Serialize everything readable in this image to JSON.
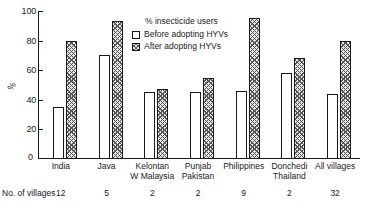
{
  "chart_data": {
    "type": "bar",
    "title": "",
    "xlabel": "",
    "ylabel": "%",
    "ylim": [
      0,
      100
    ],
    "yticks": [
      0,
      20,
      40,
      60,
      80,
      100
    ],
    "ytick_labels": [
      "0",
      "20",
      "40",
      "60",
      "80",
      "100"
    ],
    "grid": false,
    "legend_position": "inside-top-center",
    "legend_title": "% insecticide users",
    "categories": [
      "India",
      "Java",
      "Kelontan W Malaysia",
      "Punjab Pakistan",
      "Philippines",
      "Donchedi Thailand",
      "All villages"
    ],
    "category_lines": [
      [
        "India",
        ""
      ],
      [
        "Java",
        ""
      ],
      [
        "Kelontan",
        "W Malaysia"
      ],
      [
        "Punjab",
        "Pakistan"
      ],
      [
        "Philippines",
        ""
      ],
      [
        "Donchedi",
        "Thailand"
      ],
      [
        "All villages",
        ""
      ]
    ],
    "series": [
      {
        "name": "Before adopting HYVs",
        "values": [
          35,
          70,
          45,
          45,
          46,
          58,
          44
        ]
      },
      {
        "name": "After adopting HYVs",
        "values": [
          80,
          93,
          47,
          55,
          95,
          68,
          80
        ]
      }
    ],
    "annotations": {
      "villages_caption": "No. of villages",
      "villages_counts": [
        "12",
        "5",
        "2",
        "2",
        "9",
        "2",
        "32"
      ]
    },
    "zero_label": "0"
  }
}
